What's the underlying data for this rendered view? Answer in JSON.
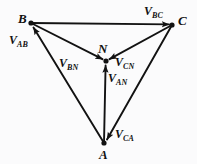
{
  "figure": {
    "type": "phasor-diagram",
    "background_color": "#fbfbfc",
    "stroke_color": "#121212",
    "width": 197,
    "height": 164,
    "nodes": [
      {
        "id": "B",
        "label": "B",
        "x": 31,
        "y": 23,
        "label_x": 18,
        "label_y": 12
      },
      {
        "id": "C",
        "label": "C",
        "x": 172,
        "y": 25,
        "label_x": 178,
        "label_y": 14
      },
      {
        "id": "A",
        "label": "A",
        "x": 104,
        "y": 143,
        "label_x": 99,
        "label_y": 148
      },
      {
        "id": "N",
        "label": "N",
        "x": 106,
        "y": 61,
        "label_x": 98,
        "label_y": 42
      }
    ],
    "vectors": [
      {
        "id": "V_AB",
        "label": "V",
        "subscript": "AB",
        "from": "A",
        "to": "B",
        "label_x": 9,
        "label_y": 34
      },
      {
        "id": "V_BC",
        "label": "V",
        "subscript": "BC",
        "from": "B",
        "to": "C",
        "label_x": 144,
        "label_y": 5
      },
      {
        "id": "V_CA",
        "label": "V",
        "subscript": "CA",
        "from": "C",
        "to": "A",
        "label_x": 115,
        "label_y": 128
      },
      {
        "id": "V_BN",
        "label": "V",
        "subscript": "BN",
        "from": "B",
        "to": "N",
        "label_x": 59,
        "label_y": 57
      },
      {
        "id": "V_CN",
        "label": "V",
        "subscript": "CN",
        "from": "C",
        "to": "N",
        "label_x": 115,
        "label_y": 56
      },
      {
        "id": "V_AN",
        "label": "V",
        "subscript": "AN",
        "from": "A",
        "to": "N",
        "label_x": 108,
        "label_y": 72
      }
    ]
  }
}
